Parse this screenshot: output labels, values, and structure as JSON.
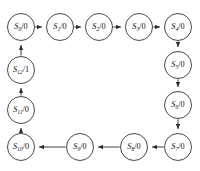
{
  "figure": {
    "type": "state-transition-diagram",
    "title_fragment": "",
    "machine_style": "Moore",
    "topology": "single directed ring (13-state counter)",
    "label_format": "S{index}/{output}",
    "colors": {
      "background": "#ffffff",
      "node_fill": "#ffffff",
      "node_stroke": "#1a1a1a",
      "edge": "#2b2b2b",
      "text": "#111111"
    },
    "geometry": {
      "width": 200,
      "height": 171,
      "node_radius": 13.5
    }
  },
  "nodes": [
    {
      "id": "S0",
      "state": "S",
      "subscript": "0",
      "output": "0",
      "separator": "/",
      "cx": 21,
      "cy": 27,
      "label": "S0/0"
    },
    {
      "id": "S1",
      "state": "S",
      "subscript": "1",
      "output": "0",
      "separator": "/",
      "cx": 60,
      "cy": 27,
      "label": "S1/0"
    },
    {
      "id": "S2",
      "state": "S",
      "subscript": "2",
      "output": "0",
      "separator": "/",
      "cx": 99,
      "cy": 27,
      "label": "S2/0"
    },
    {
      "id": "S3",
      "state": "S",
      "subscript": "3",
      "output": "0",
      "separator": "/",
      "cx": 139,
      "cy": 27,
      "label": "S3/0"
    },
    {
      "id": "S4",
      "state": "S",
      "subscript": "4",
      "output": "0",
      "separator": "/",
      "cx": 178,
      "cy": 27,
      "label": "S4/0"
    },
    {
      "id": "S5",
      "state": "S",
      "subscript": "5",
      "output": "0",
      "separator": "/",
      "cx": 178,
      "cy": 65,
      "label": "S5/0"
    },
    {
      "id": "S6",
      "state": "S",
      "subscript": "6",
      "output": "0",
      "separator": "/",
      "cx": 178,
      "cy": 105,
      "label": "S6/0"
    },
    {
      "id": "S7",
      "state": "S",
      "subscript": "7",
      "output": "0",
      "separator": "/",
      "cx": 178,
      "cy": 147,
      "label": "S7/0"
    },
    {
      "id": "S8",
      "state": "S",
      "subscript": "8",
      "output": "0",
      "separator": "/",
      "cx": 134,
      "cy": 147,
      "label": "S8/0"
    },
    {
      "id": "S9",
      "state": "S",
      "subscript": "9",
      "output": "0",
      "separator": "/",
      "cx": 80,
      "cy": 147,
      "label": "S9/0"
    },
    {
      "id": "S10",
      "state": "S",
      "subscript": "10",
      "output": "0",
      "separator": "/",
      "cx": 21,
      "cy": 147,
      "label": "S10/0"
    },
    {
      "id": "S11",
      "state": "S",
      "subscript": "11",
      "output": "0",
      "separator": "/",
      "cx": 21,
      "cy": 110,
      "label": "S11/0"
    },
    {
      "id": "S12",
      "state": "S",
      "subscript": "12",
      "output": "1",
      "separator": "/",
      "cx": 21,
      "cy": 70,
      "label": "S12/1"
    }
  ],
  "edges": [
    {
      "from": "S0",
      "to": "S1",
      "direction": "right"
    },
    {
      "from": "S1",
      "to": "S2",
      "direction": "right"
    },
    {
      "from": "S2",
      "to": "S3",
      "direction": "right"
    },
    {
      "from": "S3",
      "to": "S4",
      "direction": "right"
    },
    {
      "from": "S4",
      "to": "S5",
      "direction": "down"
    },
    {
      "from": "S5",
      "to": "S6",
      "direction": "down"
    },
    {
      "from": "S6",
      "to": "S7",
      "direction": "down"
    },
    {
      "from": "S7",
      "to": "S8",
      "direction": "left"
    },
    {
      "from": "S8",
      "to": "S9",
      "direction": "left"
    },
    {
      "from": "S9",
      "to": "S10",
      "direction": "left"
    },
    {
      "from": "S10",
      "to": "S11",
      "direction": "up"
    },
    {
      "from": "S11",
      "to": "S12",
      "direction": "up"
    },
    {
      "from": "S12",
      "to": "S0",
      "direction": "up"
    }
  ],
  "top_artifact": {
    "text": ""
  }
}
